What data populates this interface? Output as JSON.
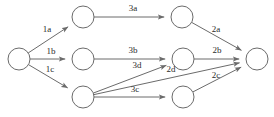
{
  "diagram": {
    "type": "directed-graph",
    "background_color": "#ffffff",
    "node_stroke_color": "#6b6b6b",
    "edge_stroke_color": "#6b6b6b",
    "label_color": "#2b2b2b",
    "node_radius": 11,
    "nodes": [
      {
        "id": "source",
        "name": "source-node",
        "cx": 19,
        "cy": 59
      },
      {
        "id": "top_mid",
        "name": "top-middle-node",
        "cx": 83,
        "cy": 17
      },
      {
        "id": "top_right",
        "name": "top-right-node",
        "cx": 182,
        "cy": 17
      },
      {
        "id": "mid_mid",
        "name": "middle-middle-node",
        "cx": 83,
        "cy": 59
      },
      {
        "id": "mid_right",
        "name": "middle-right-node",
        "cx": 183,
        "cy": 59
      },
      {
        "id": "bot_mid",
        "name": "bottom-left-node",
        "cx": 83,
        "cy": 97
      },
      {
        "id": "bot_right",
        "name": "bottom-right-node",
        "cx": 183,
        "cy": 97
      },
      {
        "id": "sink",
        "name": "sink-node",
        "cx": 257,
        "cy": 59
      }
    ],
    "edges": [
      {
        "id": "e_1a",
        "label": "1a",
        "from": "source",
        "to": "top_mid",
        "label_x": 47,
        "label_y": 30
      },
      {
        "id": "e_1b",
        "label": "1b",
        "from": "source",
        "to": "mid_mid",
        "label_x": 51,
        "label_y": 52
      },
      {
        "id": "e_1c",
        "label": "1c",
        "from": "source",
        "to": "bot_mid",
        "label_x": 50,
        "label_y": 70
      },
      {
        "id": "e_3a",
        "label": "3a",
        "from": "top_mid",
        "to": "top_right",
        "label_x": 133,
        "label_y": 9
      },
      {
        "id": "e_3b",
        "label": "3b",
        "from": "mid_mid",
        "to": "mid_right",
        "label_x": 133,
        "label_y": 51
      },
      {
        "id": "e_3c",
        "label": "3c",
        "from": "bot_mid",
        "to": "bot_right",
        "label_x": 135,
        "label_y": 90
      },
      {
        "id": "e_3d",
        "label": "3d",
        "from": "bot_mid",
        "to": "mid_right",
        "label_x": 137,
        "label_y": 66
      },
      {
        "id": "e_2a",
        "label": "2a",
        "from": "top_right",
        "to": "sink",
        "label_x": 216,
        "label_y": 30
      },
      {
        "id": "e_2b",
        "label": "2b",
        "from": "mid_right",
        "to": "sink",
        "label_x": 217,
        "label_y": 51
      },
      {
        "id": "e_2c",
        "label": "2c",
        "from": "bot_right",
        "to": "sink",
        "label_x": 216,
        "label_y": 76
      },
      {
        "id": "e_2d",
        "label": "2d",
        "from": "bot_mid",
        "to": "sink",
        "label_x": 171,
        "label_y": 70
      }
    ]
  }
}
